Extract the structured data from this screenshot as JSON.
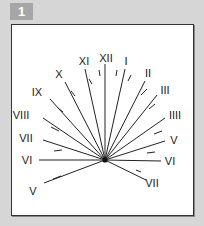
{
  "figure": {
    "badge": "1"
  },
  "dial": {
    "center": [
      105,
      160
    ],
    "line_color": "#222222",
    "hours": [
      {
        "label": "V",
        "side": "left",
        "end": [
          44,
          183
        ],
        "label_pos": [
          33,
          195
        ]
      },
      {
        "label": "VI",
        "side": "left",
        "end": [
          39,
          160
        ],
        "label_pos": [
          27,
          164
        ]
      },
      {
        "label": "VII",
        "side": "left",
        "end": [
          43,
          140
        ],
        "label_pos": [
          26,
          142
        ]
      },
      {
        "label": "VIII",
        "side": "left",
        "end": [
          43,
          118
        ],
        "label_pos": [
          21,
          119
        ]
      },
      {
        "label": "IX",
        "side": "left",
        "end": [
          50,
          99
        ],
        "label_pos": [
          37,
          96
        ]
      },
      {
        "label": "X",
        "side": "left",
        "end": [
          65,
          82
        ],
        "label_pos": [
          59,
          78
        ]
      },
      {
        "label": "XI",
        "side": "left",
        "end": [
          85,
          69
        ],
        "label_pos": [
          84,
          65
        ]
      },
      {
        "label": "XII",
        "side": "top",
        "end": [
          105,
          64
        ],
        "label_pos": [
          106,
          62
        ]
      },
      {
        "label": "I",
        "side": "right",
        "end": [
          125,
          69
        ],
        "label_pos": [
          126,
          65
        ]
      },
      {
        "label": "II",
        "side": "right",
        "end": [
          145,
          81
        ],
        "label_pos": [
          148,
          77
        ]
      },
      {
        "label": "III",
        "side": "right",
        "end": [
          157,
          95
        ],
        "label_pos": [
          165,
          94
        ]
      },
      {
        "label": "IIII",
        "side": "right",
        "end": [
          165,
          118
        ],
        "label_pos": [
          175,
          119
        ]
      },
      {
        "label": "V",
        "side": "right",
        "end": [
          165,
          141
        ],
        "label_pos": [
          174,
          144
        ]
      },
      {
        "label": "VI",
        "side": "right",
        "end": [
          161,
          161
        ],
        "label_pos": [
          170,
          165
        ]
      },
      {
        "label": "VII",
        "side": "right",
        "end": [
          146,
          180
        ],
        "label_pos": [
          152,
          187
        ]
      }
    ],
    "half_hour_ticks": [
      [
        [
          53,
          179
        ],
        [
          61,
          176
        ]
      ],
      [
        [
          54,
          151
        ],
        [
          62,
          150
        ]
      ],
      [
        [
          51,
          127
        ],
        [
          59,
          131
        ]
      ],
      [
        [
          58,
          108
        ],
        [
          63,
          112
        ]
      ],
      [
        [
          71,
          91
        ],
        [
          75,
          96
        ]
      ],
      [
        [
          89,
          79
        ],
        [
          92,
          84
        ]
      ],
      [
        [
          99,
          70
        ],
        [
          100,
          76
        ]
      ],
      [
        [
          117,
          70
        ],
        [
          116,
          76
        ]
      ],
      [
        [
          131,
          75
        ],
        [
          128,
          81
        ]
      ],
      [
        [
          147,
          89
        ],
        [
          141,
          95
        ]
      ],
      [
        [
          155,
          104
        ],
        [
          149,
          109
        ]
      ],
      [
        [
          162,
          131
        ],
        [
          154,
          134
        ]
      ],
      [
        [
          155,
          152
        ],
        [
          147,
          153
        ]
      ],
      [
        [
          141,
          172
        ],
        [
          136,
          170
        ]
      ]
    ]
  }
}
